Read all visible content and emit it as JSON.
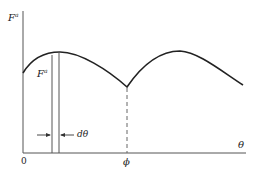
{
  "diagram": {
    "y_axis_label": "F",
    "y_axis_label_sup": "a",
    "x_axis_label": "θ",
    "strip_label": "F",
    "strip_label_sup": "a",
    "width_label": "dθ",
    "origin_label": "0",
    "phi_label": "ϕ",
    "colors": {
      "axis": "#555555",
      "curve": "#222222",
      "strip": "#555555",
      "dashed": "#666666"
    }
  }
}
